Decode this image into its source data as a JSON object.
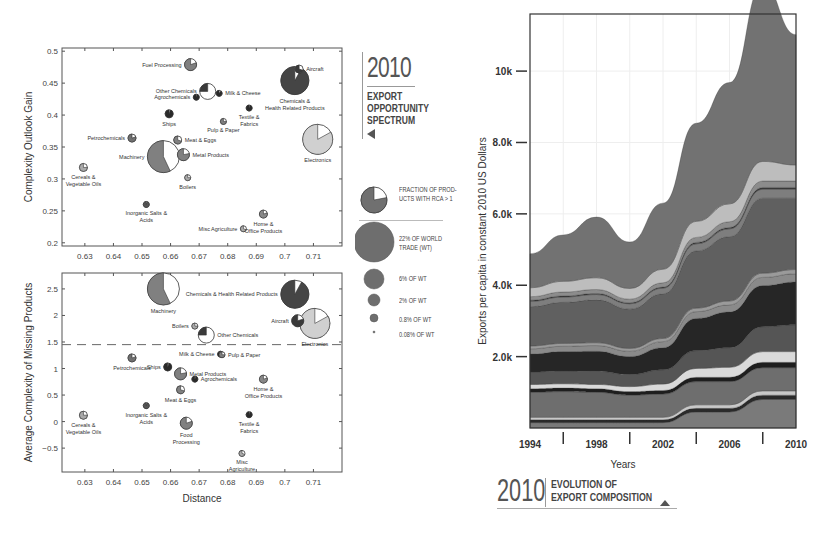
{
  "chart_data": [
    {
      "type": "scatter",
      "subtype": "bubble-pie",
      "title": "2010 Export Opportunity Spectrum",
      "xlabel": "",
      "ylabel": "Complexity Outlook Gain",
      "xlim": [
        0.622,
        0.72
      ],
      "ylim": [
        0.195,
        0.505
      ],
      "xticks": [
        "0.63",
        "0.64",
        "0.65",
        "0.66",
        "0.67",
        "0.68",
        "0.69",
        "0.7",
        "0.71"
      ],
      "yticks": [
        "0.2",
        "0.25",
        "0.3",
        "0.35",
        "0.4",
        "0.45",
        "0.5"
      ],
      "grid": false,
      "points": [
        {
          "label": "Fuel Processing",
          "x": 0.667,
          "y": 0.479,
          "r": 6,
          "fraction": 0.8,
          "color": "#808080",
          "label_pos": "left"
        },
        {
          "label": "Other Chemicals",
          "x": 0.673,
          "y": 0.437,
          "r": 8,
          "fraction": 0.25,
          "color": "#3a3a3a",
          "label_pos": "left"
        },
        {
          "label": "Agrochemicals",
          "x": 0.669,
          "y": 0.428,
          "r": 3,
          "fraction": 0.95,
          "color": "#2a2a2a",
          "label_pos": "left"
        },
        {
          "label": "Milk & Cheese",
          "x": 0.677,
          "y": 0.434,
          "r": 3,
          "fraction": 0.9,
          "color": "#2a2a2a",
          "label_pos": "right"
        },
        {
          "label": "Aircraft",
          "x": 0.705,
          "y": 0.472,
          "r": 4,
          "fraction": 0.7,
          "color": "#3a3a3a",
          "label_pos": "right"
        },
        {
          "label": "Chemicals & Health Related Products",
          "x": 0.7035,
          "y": 0.454,
          "r": 14,
          "fraction": 0.92,
          "color": "#454545",
          "label_pos": "below"
        },
        {
          "label": "Ships",
          "x": 0.6595,
          "y": 0.402,
          "r": 4,
          "fraction": 0.95,
          "color": "#2a2a2a",
          "label_pos": "below"
        },
        {
          "label": "Textile & Fabrics",
          "x": 0.6875,
          "y": 0.411,
          "r": 3,
          "fraction": 0.95,
          "color": "#2a2a2a",
          "label_pos": "below"
        },
        {
          "label": "Pulp & Paper",
          "x": 0.6785,
          "y": 0.39,
          "r": 3,
          "fraction": 0.75,
          "color": "#808080",
          "label_pos": "below"
        },
        {
          "label": "Petrochemicals",
          "x": 0.6465,
          "y": 0.364,
          "r": 4,
          "fraction": 0.8,
          "color": "#707070",
          "label_pos": "left"
        },
        {
          "label": "Meat & Eggs",
          "x": 0.6625,
          "y": 0.361,
          "r": 4,
          "fraction": 0.7,
          "color": "#808080",
          "label_pos": "right"
        },
        {
          "label": "Machinery",
          "x": 0.6575,
          "y": 0.335,
          "r": 16,
          "fraction": 0.57,
          "color": "#808080",
          "label_pos": "left"
        },
        {
          "label": "Metal Products",
          "x": 0.6645,
          "y": 0.338,
          "r": 6,
          "fraction": 0.78,
          "color": "#808080",
          "label_pos": "right"
        },
        {
          "label": "Electronics",
          "x": 0.7115,
          "y": 0.362,
          "r": 15,
          "fraction": 0.83,
          "color": "#d0d0d0",
          "label_pos": "below"
        },
        {
          "label": "Cereals & Vegetable Oils",
          "x": 0.6295,
          "y": 0.318,
          "r": 4,
          "fraction": 0.75,
          "color": "#aaaaaa",
          "label_pos": "below"
        },
        {
          "label": "Boilers",
          "x": 0.666,
          "y": 0.302,
          "r": 3,
          "fraction": 0.75,
          "color": "#aaaaaa",
          "label_pos": "below"
        },
        {
          "label": "Inorganic Salts & Acids",
          "x": 0.6515,
          "y": 0.26,
          "r": 3,
          "fraction": 0.95,
          "color": "#555555",
          "label_pos": "below"
        },
        {
          "label": "Home & Office Products",
          "x": 0.6925,
          "y": 0.245,
          "r": 4,
          "fraction": 0.8,
          "color": "#888888",
          "label_pos": "below"
        },
        {
          "label": "Misc Agriculture",
          "x": 0.6855,
          "y": 0.222,
          "r": 3,
          "fraction": 0.7,
          "color": "#aaaaaa",
          "label_pos": "left"
        }
      ]
    },
    {
      "type": "scatter",
      "subtype": "bubble-pie",
      "title": "",
      "xlabel": "Distance",
      "ylabel": "Average Complexity of Missing Products",
      "xlim": [
        0.622,
        0.72
      ],
      "ylim": [
        -0.95,
        2.8
      ],
      "xticks": [
        "0.63",
        "0.64",
        "0.65",
        "0.66",
        "0.67",
        "0.68",
        "0.69",
        "0.7",
        "0.71"
      ],
      "yticks": [
        "-0.5",
        "0",
        "0.5",
        "1",
        "1.5",
        "2",
        "2.5"
      ],
      "reference_line": {
        "y": 1.45,
        "style": "dashed"
      },
      "grid": false,
      "points": [
        {
          "label": "Machinery",
          "x": 0.6575,
          "y": 2.5,
          "r": 16,
          "fraction": 0.57,
          "color": "#808080",
          "label_pos": "below"
        },
        {
          "label": "Chemicals & Health Related Products",
          "x": 0.7035,
          "y": 2.4,
          "r": 14,
          "fraction": 0.92,
          "color": "#454545",
          "label_pos": "left"
        },
        {
          "label": "Aircraft",
          "x": 0.7045,
          "y": 1.9,
          "r": 6,
          "fraction": 0.8,
          "color": "#3a3a3a",
          "label_pos": "left"
        },
        {
          "label": "Electronics",
          "x": 0.7105,
          "y": 1.85,
          "r": 15,
          "fraction": 0.83,
          "color": "#d0d0d0",
          "label_pos": "below"
        },
        {
          "label": "Boilers",
          "x": 0.6685,
          "y": 1.8,
          "r": 3,
          "fraction": 0.75,
          "color": "#aaaaaa",
          "label_pos": "left"
        },
        {
          "label": "Other Chemicals",
          "x": 0.6725,
          "y": 1.63,
          "r": 8,
          "fraction": 0.25,
          "color": "#3a3a3a",
          "label_pos": "right"
        },
        {
          "label": "Milk & Cheese",
          "x": 0.6775,
          "y": 1.27,
          "r": 3,
          "fraction": 0.9,
          "color": "#2a2a2a",
          "label_pos": "left"
        },
        {
          "label": "Pulp & Paper",
          "x": 0.678,
          "y": 1.26,
          "r": 3,
          "fraction": 0.75,
          "color": "#808080",
          "label_pos": "right"
        },
        {
          "label": "Petrochemicals",
          "x": 0.6465,
          "y": 1.2,
          "r": 4,
          "fraction": 0.8,
          "color": "#707070",
          "label_pos": "below"
        },
        {
          "label": "Ships",
          "x": 0.659,
          "y": 1.03,
          "r": 4,
          "fraction": 0.95,
          "color": "#2a2a2a",
          "label_pos": "left"
        },
        {
          "label": "Metal Products",
          "x": 0.6635,
          "y": 0.9,
          "r": 6,
          "fraction": 0.78,
          "color": "#808080",
          "label_pos": "right"
        },
        {
          "label": "Agrochemicals",
          "x": 0.6685,
          "y": 0.8,
          "r": 3,
          "fraction": 0.95,
          "color": "#2a2a2a",
          "label_pos": "right"
        },
        {
          "label": "Home & Office Products",
          "x": 0.6925,
          "y": 0.8,
          "r": 4,
          "fraction": 0.8,
          "color": "#888888",
          "label_pos": "below"
        },
        {
          "label": "Meat & Eggs",
          "x": 0.6635,
          "y": 0.6,
          "r": 4,
          "fraction": 0.7,
          "color": "#808080",
          "label_pos": "below"
        },
        {
          "label": "Inorganic Salts & Acids",
          "x": 0.6515,
          "y": 0.3,
          "r": 3,
          "fraction": 0.95,
          "color": "#555555",
          "label_pos": "below"
        },
        {
          "label": "Textile & Fabrics",
          "x": 0.6875,
          "y": 0.13,
          "r": 3,
          "fraction": 0.95,
          "color": "#2a2a2a",
          "label_pos": "below"
        },
        {
          "label": "Cereals & Vegetable Oils",
          "x": 0.6295,
          "y": 0.12,
          "r": 4,
          "fraction": 0.75,
          "color": "#aaaaaa",
          "label_pos": "below"
        },
        {
          "label": "Food Processing",
          "x": 0.6655,
          "y": -0.03,
          "r": 6,
          "fraction": 0.8,
          "color": "#808080",
          "label_pos": "below"
        },
        {
          "label": "Misc Agriculture",
          "x": 0.685,
          "y": -0.6,
          "r": 3,
          "fraction": 0.7,
          "color": "#aaaaaa",
          "label_pos": "below"
        }
      ]
    },
    {
      "type": "area",
      "subtype": "stacked",
      "title": "2010 Evolution of Export Composition",
      "xlabel": "Years",
      "ylabel": "Exports per capita in constant 2010 US Dollars",
      "xlim": [
        1994,
        2010
      ],
      "ylim": [
        0,
        11600
      ],
      "xticks": [
        "1994",
        "1998",
        "2002",
        "2006",
        "2010"
      ],
      "yticks": [
        "2.0k",
        "4.0k",
        "6.0k",
        "8.0k",
        "10k"
      ],
      "grid": true,
      "x": [
        1994,
        1996,
        1998,
        2000,
        2002,
        2004,
        2006,
        2008,
        2010
      ],
      "series": [
        {
          "name": "layer-1",
          "color": "#7a7a7a",
          "values": [
            150,
            150,
            150,
            150,
            150,
            450,
            450,
            800,
            800
          ]
        },
        {
          "name": "layer-2",
          "color": "#2a2a2a",
          "values": [
            80,
            80,
            80,
            80,
            80,
            100,
            100,
            120,
            120
          ]
        },
        {
          "name": "layer-3",
          "color": "#c8c8c8",
          "values": [
            70,
            70,
            70,
            70,
            70,
            100,
            100,
            120,
            120
          ]
        },
        {
          "name": "layer-4",
          "color": "#6e6e6e",
          "values": [
            700,
            720,
            700,
            620,
            650,
            650,
            650,
            650,
            650
          ]
        },
        {
          "name": "layer-5",
          "color": "#1e1e1e",
          "values": [
            100,
            100,
            100,
            100,
            100,
            120,
            120,
            150,
            150
          ]
        },
        {
          "name": "layer-6",
          "color": "#dadada",
          "values": [
            120,
            120,
            120,
            140,
            180,
            250,
            280,
            300,
            300
          ]
        },
        {
          "name": "layer-7",
          "color": "#555555",
          "values": [
            350,
            360,
            370,
            340,
            400,
            500,
            550,
            700,
            750
          ]
        },
        {
          "name": "layer-8",
          "color": "#262626",
          "values": [
            500,
            540,
            560,
            500,
            620,
            900,
            1000,
            1150,
            1200
          ]
        },
        {
          "name": "layer-9",
          "color": "#8a8a8a",
          "values": [
            150,
            150,
            160,
            150,
            170,
            190,
            200,
            230,
            230
          ]
        },
        {
          "name": "layer-10",
          "color": "#9a9a9a",
          "values": [
            80,
            80,
            80,
            80,
            90,
            100,
            110,
            120,
            120
          ]
        },
        {
          "name": "layer-11",
          "color": "#606060",
          "values": [
            1100,
            1150,
            1200,
            1100,
            1250,
            1600,
            1800,
            2100,
            2000
          ]
        },
        {
          "name": "layer-12",
          "color": "#7e7e7e",
          "values": [
            150,
            150,
            150,
            150,
            160,
            200,
            220,
            250,
            250
          ]
        },
        {
          "name": "layer-13",
          "color": "#3a3a3a",
          "values": [
            30,
            30,
            30,
            30,
            30,
            40,
            40,
            50,
            50
          ]
        },
        {
          "name": "layer-14",
          "color": "#8c8c8c",
          "values": [
            100,
            110,
            110,
            100,
            120,
            140,
            160,
            180,
            180
          ]
        },
        {
          "name": "layer-15",
          "color": "#bdbdbd",
          "values": [
            250,
            300,
            330,
            300,
            380,
            450,
            500,
            550,
            450
          ]
        },
        {
          "name": "layer-16",
          "color": "#727272",
          "values": [
            950,
            1300,
            1700,
            1300,
            1850,
            2750,
            3400,
            4950,
            3650
          ]
        }
      ]
    }
  ],
  "panel_top": {
    "ylabel": "Complexity Outlook Gain",
    "xticks": [
      "0.63",
      "0.64",
      "0.65",
      "0.66",
      "0.67",
      "0.68",
      "0.69",
      "0.7",
      "0.71"
    ],
    "yticks": [
      "0.2",
      "0.25",
      "0.3",
      "0.35",
      "0.4",
      "0.45",
      "0.5"
    ]
  },
  "panel_bottom": {
    "ylabel": "Average Complexity of Missing Products",
    "xlabel": "Distance",
    "xticks": [
      "0.63",
      "0.64",
      "0.65",
      "0.66",
      "0.67",
      "0.68",
      "0.69",
      "0.7",
      "0.71"
    ],
    "yticks": [
      "-0.5",
      "0",
      "0.5",
      "1",
      "1.5",
      "2",
      "2.5"
    ]
  },
  "title_spectrum": {
    "year": "2010",
    "line1": "EXPORT",
    "line2": "OPPORTUNITY",
    "line3": "SPECTRUM"
  },
  "legend": {
    "fraction_label_1": "FRACTION OF PROD-",
    "fraction_label_2": "UCTS WITH RCA > 1",
    "sizes": [
      {
        "label_1": "22% OF WORLD",
        "label_2": "TRADE (WT)",
        "r": 20
      },
      {
        "label_1": "6% OF WT",
        "label_2": "",
        "r": 10
      },
      {
        "label_1": "2% OF WT",
        "label_2": "",
        "r": 6
      },
      {
        "label_1": "0.8% OF WT",
        "label_2": "",
        "r": 4
      },
      {
        "label_1": "0.08% OF WT",
        "label_2": "",
        "r": 1
      }
    ]
  },
  "panel_right": {
    "ylabel": "Exports per capita in constant 2010 US Dollars",
    "xlabel": "Years",
    "xticks": [
      "1994",
      "1998",
      "2002",
      "2006",
      "2010"
    ],
    "yticks": [
      "2.0k",
      "4.0k",
      "6.0k",
      "8.0k",
      "10k"
    ]
  },
  "title_evolution": {
    "year": "2010",
    "line1": "EVOLUTION OF",
    "line2": "EXPORT COMPOSITION"
  }
}
